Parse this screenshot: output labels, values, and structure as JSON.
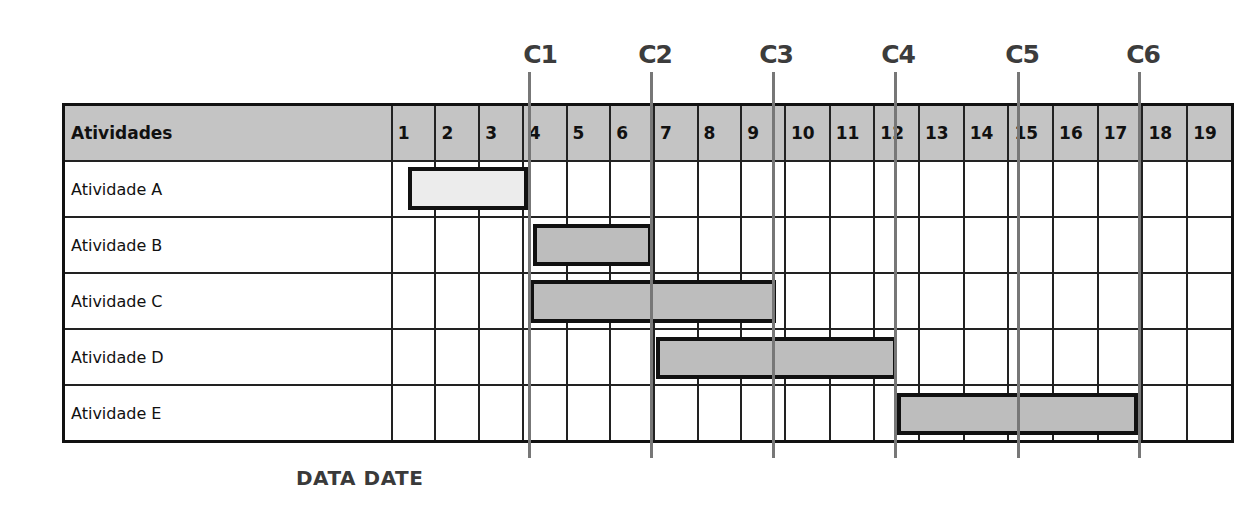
{
  "table": {
    "header_label": "Atividades",
    "days": [
      "1",
      "2",
      "3",
      "4",
      "5",
      "6",
      "7",
      "8",
      "9",
      "10",
      "11",
      "12",
      "13",
      "14",
      "15",
      "16",
      "17",
      "18",
      "19"
    ],
    "activities": [
      {
        "name": "Atividade A",
        "start_day": 1,
        "end_day": 3,
        "fill": "#ececec"
      },
      {
        "name": "Atividade B",
        "start_day": 4,
        "end_day": 6,
        "fill": "#bdbdbd"
      },
      {
        "name": "Atividade C",
        "start_day": 4,
        "end_day": 9,
        "fill": "#bdbdbd"
      },
      {
        "name": "Atividade D",
        "start_day": 7,
        "end_day": 12,
        "fill": "#bdbdbd"
      },
      {
        "name": "Atividade E",
        "start_day": 13,
        "end_day": 18,
        "fill": "#bdbdbd"
      }
    ]
  },
  "milestones": [
    {
      "label": "C1",
      "after_day": 3
    },
    {
      "label": "C2",
      "after_day": 6
    },
    {
      "label": "C3",
      "after_day": 9
    },
    {
      "label": "C4",
      "after_day": 12
    },
    {
      "label": "C5",
      "after_day": 15
    },
    {
      "label": "C6",
      "after_day": 18
    }
  ],
  "data_date_label": "DATA DATE",
  "colors": {
    "header_fill": "#c4c4c4",
    "bar_fill": "#bdbdbd",
    "bar_fill_completed": "#ececec",
    "milestone_line": "#777777",
    "border": "#111111"
  }
}
